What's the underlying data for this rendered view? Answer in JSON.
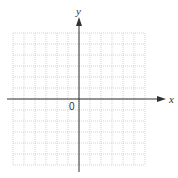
{
  "diagram": {
    "type": "cartesian-coordinate-grid",
    "x_axis_label": "x",
    "y_axis_label": "y",
    "origin_label": "0",
    "grid": {
      "columns": 12,
      "rows": 12,
      "cells_left_of_y_axis": 6,
      "cells_right_of_y_axis": 6,
      "cells_above_x_axis": 6,
      "cells_below_x_axis": 6,
      "line_style": "dotted"
    },
    "colors": {
      "grid": "#c8c8c8",
      "axis": "#333333",
      "background": "#ffffff"
    }
  }
}
